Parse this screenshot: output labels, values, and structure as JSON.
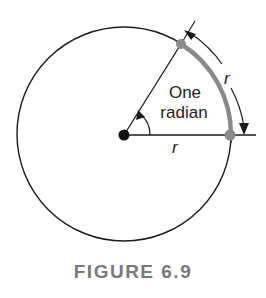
{
  "figure": {
    "caption": "FIGURE 6.9",
    "angle_label_line1": "One",
    "angle_label_line2": "radian",
    "radius_label": "r",
    "arc_length_label": "r"
  },
  "geometry": {
    "center": [
      124,
      135
    ],
    "radius": 107,
    "angle_radians": 1,
    "dimension_arc_radius": 120
  },
  "colors": {
    "line": "#1a1a1a",
    "highlight_arc": "#8a8a8a",
    "highlight_points": "#8a8a8a",
    "center_point": "#111111",
    "caption": "#7a7a7a"
  }
}
